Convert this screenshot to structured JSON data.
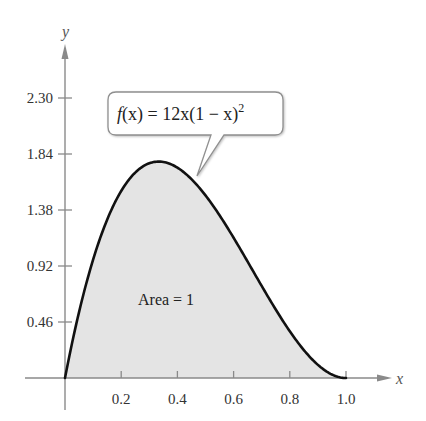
{
  "chart_data": {
    "type": "area",
    "title": "",
    "function": "f(x) = 12x(1 − x)^2",
    "xlabel": "x",
    "ylabel": "y",
    "x_ticks": [
      "0.2",
      "0.4",
      "0.6",
      "0.8",
      "1.0"
    ],
    "x_tick_values": [
      0.2,
      0.4,
      0.6,
      0.8,
      1.0
    ],
    "y_ticks": [
      "0.46",
      "0.92",
      "1.38",
      "1.84",
      "2.30"
    ],
    "y_tick_values": [
      0.46,
      0.92,
      1.38,
      1.84,
      2.3
    ],
    "xlim": [
      0,
      1.1
    ],
    "ylim": [
      0,
      2.5
    ],
    "x": [
      0,
      0.05,
      0.1,
      0.15,
      0.2,
      0.25,
      0.3,
      0.333,
      0.35,
      0.4,
      0.45,
      0.5,
      0.55,
      0.6,
      0.65,
      0.7,
      0.75,
      0.8,
      0.85,
      0.9,
      0.95,
      1.0
    ],
    "values": [
      0,
      0.5415,
      0.972,
      1.3005,
      1.536,
      1.6875,
      1.764,
      1.7778,
      1.7745,
      1.728,
      1.6335,
      1.5,
      1.3365,
      1.152,
      0.9555,
      0.756,
      0.5625,
      0.384,
      0.2295,
      0.108,
      0.0285,
      0
    ],
    "annotations": [
      {
        "text": "f(x) = 12x(1 − x)²",
        "type": "callout"
      },
      {
        "text": "Area = 1",
        "type": "label"
      }
    ],
    "fill_color": "#e6e6e6",
    "curve_color": "#111111",
    "grid": false,
    "legend": "none"
  },
  "labels": {
    "y_axis": "y",
    "x_axis": "x",
    "callout_f": "f",
    "callout_rest": "(x) = 12x(1 − x)",
    "callout_exp": "2",
    "area": "Area = 1",
    "yticks": [
      "0.46",
      "0.92",
      "1.38",
      "1.84",
      "2.30"
    ],
    "xticks": [
      "0.2",
      "0.4",
      "0.6",
      "0.8",
      "1.0"
    ]
  }
}
